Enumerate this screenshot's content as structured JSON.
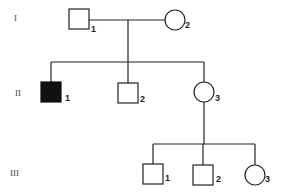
{
  "diagram": {
    "type": "pedigree",
    "generations": [
      {
        "label": "I",
        "members": [
          {
            "id": "I-1",
            "number": "1",
            "sex": "male",
            "affected": false
          },
          {
            "id": "I-2",
            "number": "2",
            "sex": "female",
            "affected": false
          }
        ]
      },
      {
        "label": "II",
        "members": [
          {
            "id": "II-1",
            "number": "1",
            "sex": "male",
            "affected": true
          },
          {
            "id": "II-2",
            "number": "2",
            "sex": "male",
            "affected": false
          },
          {
            "id": "II-3",
            "number": "3",
            "sex": "female",
            "affected": false
          }
        ]
      },
      {
        "label": "III",
        "members": [
          {
            "id": "III-1",
            "number": "1",
            "sex": "male",
            "affected": false
          },
          {
            "id": "III-2",
            "number": "2",
            "sex": "male",
            "affected": false
          },
          {
            "id": "III-3",
            "number": "3",
            "sex": "female",
            "affected": false
          }
        ]
      }
    ],
    "relationships": [
      {
        "couple": [
          "I-1",
          "I-2"
        ],
        "children": [
          "II-1",
          "II-2",
          "II-3"
        ]
      },
      {
        "parent": "II-3",
        "children": [
          "III-1",
          "III-2",
          "III-3"
        ]
      }
    ],
    "colors": {
      "line": "#222222",
      "affected": "#111111",
      "background": "#ffffff"
    }
  }
}
